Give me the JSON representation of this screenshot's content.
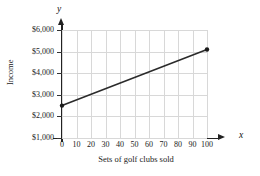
{
  "chart_data": {
    "type": "line",
    "title": "",
    "xlabel": "Sets of golf clubs sold",
    "ylabel": "Income",
    "x_axis_letter": "x",
    "y_axis_letter": "y",
    "xlim": [
      0,
      100
    ],
    "ylim": [
      0,
      6000
    ],
    "grid": true,
    "legend": "none",
    "x_ticks": [
      0,
      10,
      20,
      30,
      40,
      50,
      60,
      70,
      80,
      90,
      100
    ],
    "x_tick_labels": [
      "0",
      "10",
      "20",
      "30",
      "40",
      "50",
      "60",
      "70",
      "80",
      "90",
      "100"
    ],
    "y_ticks": [
      1000,
      2000,
      3000,
      4000,
      5000,
      6000
    ],
    "y_tick_labels": [
      "$1,000",
      "$2,000",
      "$3,000",
      "$4,000",
      "$5,000",
      "$6,000"
    ],
    "gridlines_x": [
      0,
      10,
      20,
      30,
      40,
      50,
      60,
      70,
      80,
      90,
      100
    ],
    "gridlines_y": [
      1000,
      2000,
      3000,
      4000,
      5000,
      6000
    ],
    "series": [
      {
        "name": "Income",
        "x": [
          0,
          100
        ],
        "values": [
          2500,
          5100
        ],
        "markers": [
          {
            "x": 0,
            "y": 2500
          },
          {
            "x": 100,
            "y": 5100
          }
        ],
        "color": "#2b2b2b",
        "slope": 26,
        "intercept": 2500
      }
    ],
    "colors": {
      "line": "#2b2b2b",
      "marker": "#1a1a1a",
      "axis": "#222222",
      "grid": "#d8d8d8",
      "text": "#1a1a1a",
      "background": "#ffffff"
    }
  }
}
